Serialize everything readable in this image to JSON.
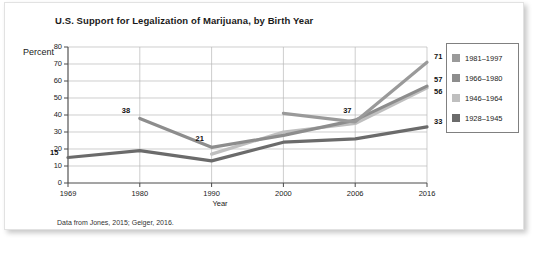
{
  "figure": {
    "title": "U.S. Support for Legalization of Marijuana, by Birth Year",
    "source_note": "Data from Jones, 2015; Geiger, 2016."
  },
  "legend": {
    "items": [
      {
        "label": "1981–1997",
        "color": "#9a9a9a"
      },
      {
        "label": "1966–1980",
        "color": "#8d8d8d"
      },
      {
        "label": "1946–1964",
        "color": "#bfbfbf"
      },
      {
        "label": "1928–1945",
        "color": "#6b6b6b"
      }
    ]
  },
  "chart_data": {
    "type": "line",
    "title": "U.S. Support for Legalization of Marijuana, by Birth Year",
    "xlabel": "Year",
    "ylabel": "Percent",
    "categories": [
      "1969",
      "1980",
      "1990",
      "2000",
      "2006",
      "2016"
    ],
    "ylim": [
      0,
      80
    ],
    "ytick_labels": [
      "0",
      "10",
      "20",
      "30",
      "40",
      "50",
      "60",
      "70",
      "80"
    ],
    "ytick_values": [
      0,
      10,
      20,
      30,
      40,
      50,
      60,
      70,
      80
    ],
    "grid": true,
    "legend_position": "right",
    "series": [
      {
        "name": "1981–1997",
        "color": "#9a9a9a",
        "values": [
          null,
          null,
          null,
          41,
          36,
          71
        ]
      },
      {
        "name": "1966–1980",
        "color": "#8d8d8d",
        "values": [
          null,
          38,
          21,
          28,
          37,
          57
        ]
      },
      {
        "name": "1946–1964",
        "color": "#bfbfbf",
        "values": [
          null,
          null,
          17,
          30,
          35,
          56
        ]
      },
      {
        "name": "1928–1945",
        "color": "#6b6b6b",
        "values": [
          15,
          19,
          13,
          24,
          26,
          33
        ]
      }
    ],
    "annotations": [
      {
        "text": "15",
        "category": "1969",
        "value": 15
      },
      {
        "text": "38",
        "category": "1980",
        "value": 38
      },
      {
        "text": "21",
        "category": "1990",
        "value": 21
      },
      {
        "text": "37",
        "category": "2006",
        "value": 37
      },
      {
        "text": "71",
        "category": "2016",
        "value": 71
      },
      {
        "text": "57",
        "category": "2016",
        "value": 57
      },
      {
        "text": "56",
        "category": "2016",
        "value": 56
      },
      {
        "text": "33",
        "category": "2016",
        "value": 33
      }
    ]
  }
}
